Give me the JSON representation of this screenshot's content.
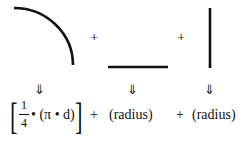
{
  "diagram": {
    "shapes": [
      {
        "name": "quarter-arc",
        "type": "arc"
      },
      {
        "name": "horizontal-line",
        "type": "line"
      },
      {
        "name": "vertical-line",
        "type": "line"
      }
    ],
    "top_plus_1": "+",
    "top_plus_2": "+",
    "arrows": [
      "⇓",
      "⇓",
      "⇓"
    ],
    "formula": {
      "left_bracket": "[",
      "frac_num": "1",
      "frac_den": "4",
      "term1_rest": "• (π • d)",
      "right_bracket": "]",
      "plus1": "+",
      "term2": "(radius)",
      "plus2": "+",
      "term3": "(radius)"
    }
  }
}
